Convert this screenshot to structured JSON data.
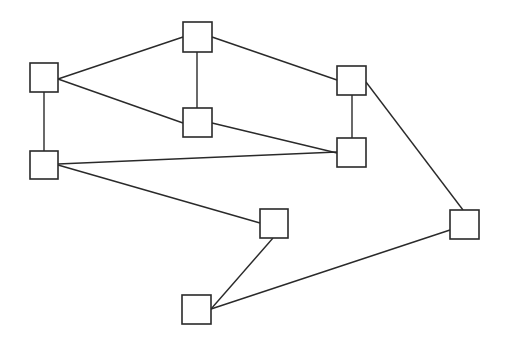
{
  "diagram": {
    "type": "undirected-graph",
    "node_shape": "square",
    "colors": {
      "background": "#ffffff",
      "stroke": "#2a2a2a",
      "node_fill": "#ffffff"
    },
    "nodes": [
      {
        "id": "A",
        "label": ""
      },
      {
        "id": "B",
        "label": ""
      },
      {
        "id": "C",
        "label": ""
      },
      {
        "id": "D",
        "label": ""
      },
      {
        "id": "E",
        "label": ""
      },
      {
        "id": "F",
        "label": ""
      },
      {
        "id": "G",
        "label": ""
      },
      {
        "id": "H",
        "label": ""
      },
      {
        "id": "I",
        "label": ""
      }
    ],
    "edges": [
      {
        "from": "A",
        "to": "B"
      },
      {
        "from": "A",
        "to": "C"
      },
      {
        "from": "A",
        "to": "D"
      },
      {
        "from": "B",
        "to": "C"
      },
      {
        "from": "B",
        "to": "E"
      },
      {
        "from": "C",
        "to": "F"
      },
      {
        "from": "D",
        "to": "F"
      },
      {
        "from": "D",
        "to": "G"
      },
      {
        "from": "E",
        "to": "F"
      },
      {
        "from": "E",
        "to": "H"
      },
      {
        "from": "G",
        "to": "I"
      },
      {
        "from": "H",
        "to": "I"
      }
    ]
  }
}
